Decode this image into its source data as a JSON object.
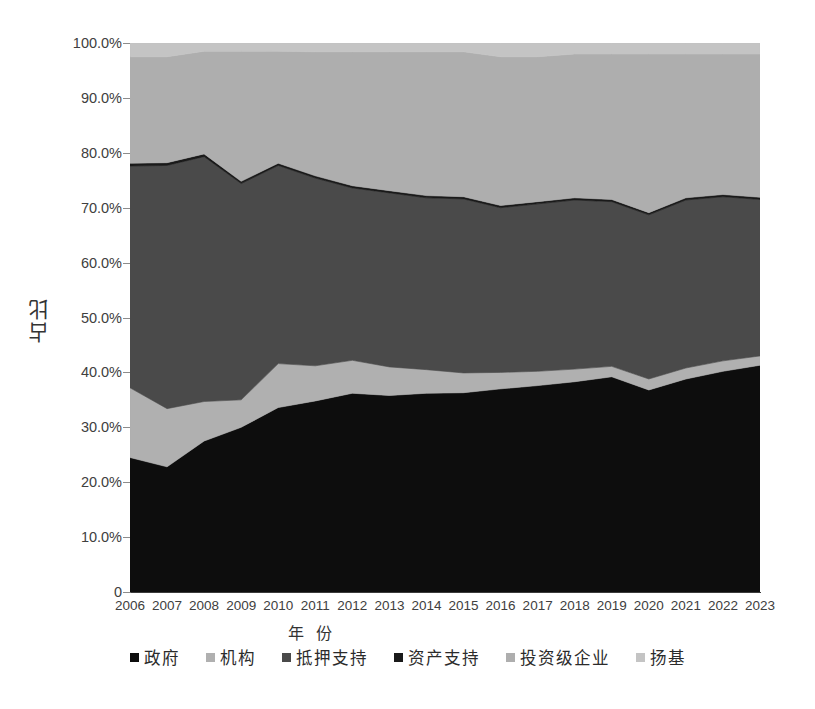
{
  "chart_data": {
    "type": "area",
    "stacked": true,
    "title": "",
    "xlabel": "年 份",
    "ylabel": "占比",
    "ylim": [
      0,
      100
    ],
    "ytick_labels": [
      "0",
      "10.0%",
      "20.0%",
      "30.0%",
      "40.0%",
      "50.0%",
      "60.0%",
      "70.0%",
      "80.0%",
      "90.0%",
      "100.0%"
    ],
    "ytick_values": [
      0,
      10,
      20,
      30,
      40,
      50,
      60,
      70,
      80,
      90,
      100
    ],
    "grid": false,
    "legend_position": "bottom",
    "categories": [
      "2006",
      "2007",
      "2008",
      "2009",
      "2010",
      "2011",
      "2012",
      "2013",
      "2014",
      "2015",
      "2016",
      "2017",
      "2018",
      "2019",
      "2020",
      "2021",
      "2022",
      "2023"
    ],
    "series": [
      {
        "name": "政府",
        "color": "#0d0d0d",
        "values": [
          24.5,
          22.8,
          27.5,
          30.0,
          33.6,
          34.8,
          36.2,
          35.8,
          36.2,
          36.3,
          37.0,
          37.6,
          38.3,
          39.2,
          36.8,
          38.8,
          40.2,
          41.3
        ]
      },
      {
        "name": "机构",
        "color": "#b0b0b0",
        "values": [
          12.7,
          10.6,
          7.2,
          5.0,
          8.0,
          6.4,
          6.0,
          5.2,
          4.3,
          3.6,
          3.0,
          2.6,
          2.3,
          1.9,
          2.0,
          2.0,
          1.9,
          1.7
        ]
      },
      {
        "name": "抵押支持",
        "color": "#4a4a4a",
        "values": [
          40.4,
          44.3,
          44.6,
          39.4,
          36.1,
          34.2,
          31.4,
          31.7,
          31.3,
          31.7,
          30.0,
          30.5,
          30.8,
          30.0,
          29.9,
          30.6,
          29.9,
          28.5
        ]
      },
      {
        "name": "资产支持",
        "color": "#1a1a1a",
        "values": [
          0.5,
          0.5,
          0.5,
          0.4,
          0.4,
          0.4,
          0.4,
          0.4,
          0.4,
          0.4,
          0.4,
          0.4,
          0.4,
          0.4,
          0.4,
          0.4,
          0.4,
          0.4
        ]
      },
      {
        "name": "投资级企业",
        "color": "#aeaeae",
        "values": [
          19.4,
          19.3,
          18.7,
          23.7,
          20.4,
          22.6,
          24.4,
          25.3,
          26.2,
          26.4,
          27.1,
          26.4,
          26.2,
          26.5,
          28.9,
          26.2,
          25.6,
          26.1
        ]
      },
      {
        "name": "扬基",
        "color": "#c4c4c4",
        "values": [
          2.5,
          2.5,
          1.5,
          1.5,
          1.5,
          1.6,
          1.6,
          1.6,
          1.6,
          1.6,
          2.5,
          2.5,
          2.0,
          2.0,
          2.0,
          2.0,
          2.0,
          2.0
        ]
      }
    ]
  },
  "axes": {
    "y_title": "占比",
    "x_title": "年 份"
  },
  "legend": {
    "items": [
      {
        "label": "政府",
        "color": "#0d0d0d"
      },
      {
        "label": "机构",
        "color": "#b0b0b0"
      },
      {
        "label": "抵押支持",
        "color": "#4a4a4a"
      },
      {
        "label": "资产支持",
        "color": "#1a1a1a"
      },
      {
        "label": "投资级企业",
        "color": "#aeaeae"
      },
      {
        "label": "扬基",
        "color": "#c4c4c4"
      }
    ]
  }
}
